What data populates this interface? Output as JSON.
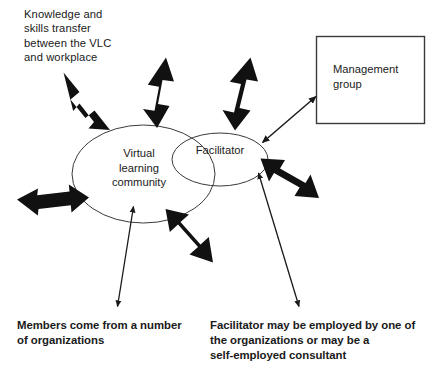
{
  "diagram": {
    "colors": {
      "ink": "#1a1a1a",
      "outline": "#3a3a3a",
      "background": "#ffffff",
      "thick_arrow": "#111111",
      "thin_arrow": "#1a1a1a"
    },
    "notes": {
      "knowledge_transfer": "Knowledge and\nskills transfer\nbetween the VLC\nand workplace"
    },
    "nodes": {
      "vlc": {
        "label": "Virtual\nlearning\ncommunity",
        "shape": "ellipse"
      },
      "facilitator": {
        "label": "Facilitator",
        "shape": "ellipse"
      },
      "management_group": {
        "label": "Management\ngroup",
        "shape": "rectangle"
      }
    },
    "captions": {
      "members": "Members come from a number\nof organizations",
      "facilitator_employment": "Facilitator may be employed by one of\nthe organizations or may be a\nself-employed consultant"
    }
  }
}
